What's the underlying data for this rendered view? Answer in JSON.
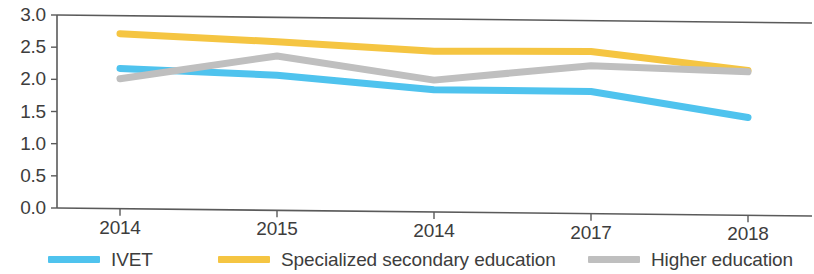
{
  "chart_data": {
    "type": "line",
    "title": "",
    "subtitle": "",
    "xlabel": "",
    "ylabel": "",
    "categories": [
      "2014",
      "2015",
      "2014",
      "2017",
      "2018"
    ],
    "ylim": [
      0.0,
      3.0
    ],
    "y_ticks": [
      "0.0",
      "0.5",
      "1.0",
      "1.5",
      "2.0",
      "2.5",
      "3.0"
    ],
    "y_tick_values": [
      0.0,
      0.5,
      1.0,
      1.5,
      2.0,
      2.5,
      3.0
    ],
    "grid": false,
    "legend_position": "bottom",
    "series": [
      {
        "name": "IVET",
        "color": "#4FC3EE",
        "values": [
          2.18,
          2.1,
          1.9,
          1.9,
          1.52
        ]
      },
      {
        "name": "Specialized secondary education",
        "color": "#F5C542",
        "values": [
          2.72,
          2.62,
          2.5,
          2.52,
          2.25
        ]
      },
      {
        "name": "Higher education",
        "color": "#BFBFBF",
        "values": [
          2.02,
          2.4,
          2.05,
          2.3,
          2.23
        ]
      }
    ]
  },
  "legend": {
    "items": [
      {
        "label": "IVET",
        "color": "#4FC3EE"
      },
      {
        "label": "Specialized secondary education",
        "color": "#F5C542"
      },
      {
        "label": "Higher education",
        "color": "#BFBFBF"
      }
    ]
  },
  "axis": {
    "line_color": "#5a5a5a"
  }
}
